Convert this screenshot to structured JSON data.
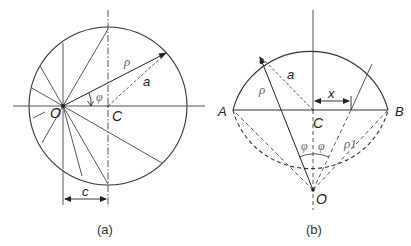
{
  "figure_a": {
    "caption": "(a)",
    "labels": {
      "origin": "O",
      "center": "C",
      "radius_vector": "ρ",
      "circle_radius": "a",
      "angle": "φ",
      "offset": "c"
    }
  },
  "figure_b": {
    "caption": "(b)",
    "labels": {
      "left_point": "A",
      "right_point": "B",
      "center": "C",
      "origin": "O",
      "radius_vector": "ρ",
      "radius_vector_1": "ρ1",
      "circle_radius": "a",
      "offset": "x",
      "angle_left": "φ",
      "angle_right": "φ"
    }
  },
  "colors": {
    "stroke": "#333333",
    "background": "#ffffff"
  }
}
